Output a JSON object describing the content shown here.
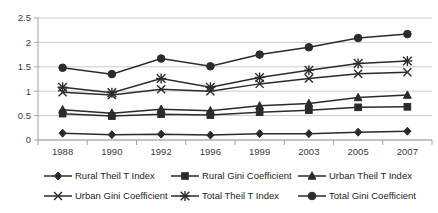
{
  "chart_data": {
    "type": "line",
    "title": "",
    "xlabel": "",
    "ylabel": "",
    "categories": [
      "1988",
      "1990",
      "1992",
      "1996",
      "1999",
      "2003",
      "2005",
      "2007"
    ],
    "ylim": [
      0,
      2.5
    ],
    "yticks": [
      "0",
      "0.5",
      "1",
      "1.5",
      "2",
      "2.5"
    ],
    "ytick_values": [
      0,
      0.5,
      1,
      1.5,
      2,
      2.5
    ],
    "grid": true,
    "legend_position": "bottom",
    "series": [
      {
        "name": "Rural Theil T Index",
        "marker": "diamond",
        "values": [
          0.14,
          0.11,
          0.12,
          0.1,
          0.13,
          0.13,
          0.16,
          0.18
        ]
      },
      {
        "name": "Rural Gini Coefficient",
        "marker": "square",
        "values": [
          0.54,
          0.49,
          0.53,
          0.51,
          0.57,
          0.61,
          0.67,
          0.68
        ]
      },
      {
        "name": "Urban Theil T Index",
        "marker": "triangle",
        "values": [
          0.62,
          0.55,
          0.63,
          0.6,
          0.7,
          0.75,
          0.87,
          0.92
        ]
      },
      {
        "name": "Urban Gini Coefficient",
        "marker": "x",
        "values": [
          0.98,
          0.92,
          1.04,
          1.0,
          1.15,
          1.26,
          1.36,
          1.39
        ]
      },
      {
        "name": "Total Theil T Index",
        "marker": "star",
        "values": [
          1.08,
          0.97,
          1.26,
          1.08,
          1.28,
          1.43,
          1.57,
          1.62
        ]
      },
      {
        "name": "Total Gini Coefficient",
        "marker": "circle",
        "values": [
          1.48,
          1.35,
          1.67,
          1.51,
          1.75,
          1.9,
          2.09,
          2.17
        ]
      }
    ]
  },
  "colors": {
    "series": "#2b2b2b",
    "grid": "#bfbfbf",
    "axis": "#9a9a9a",
    "text": "#231f20",
    "background": "#ffffff"
  },
  "legend": {
    "rows": [
      [
        "Rural Theil T Index",
        "Rural Gini Coefficient",
        "Urban Theil T Index"
      ],
      [
        "Urban Gini Coefficient",
        "Total Theil T Index",
        "Total Gini Coefficient"
      ]
    ]
  }
}
